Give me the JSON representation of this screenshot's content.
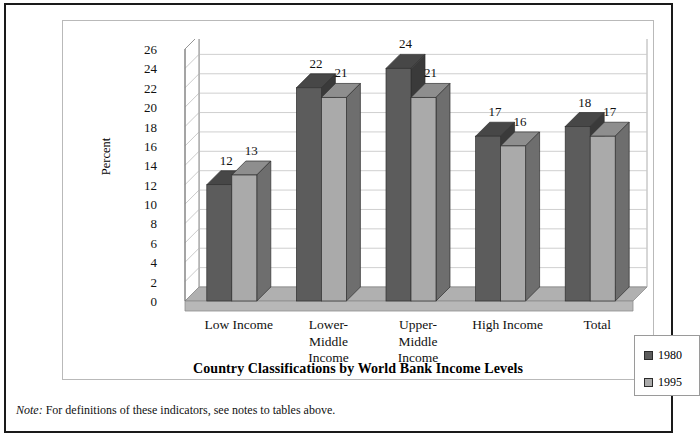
{
  "chart_data": {
    "type": "bar",
    "title": "Country Classifications by World Bank Income Levels",
    "xlabel": "",
    "ylabel": "Percent",
    "ylim": [
      0,
      26
    ],
    "ytick_step": 2,
    "yticks": [
      26,
      24,
      22,
      20,
      18,
      16,
      14,
      12,
      10,
      8,
      6,
      4,
      2,
      0
    ],
    "grid": true,
    "legend_position": "right-outside",
    "categories": [
      "Low Income",
      "Lower-\nMiddle\nIncome",
      "Upper-\nMiddle\nIncome",
      "High Income",
      "Total"
    ],
    "category_lines": [
      [
        "Low Income"
      ],
      [
        "Lower-",
        "Middle",
        "Income"
      ],
      [
        "Upper-",
        "Middle",
        "Income"
      ],
      [
        "High Income"
      ],
      [
        "Total"
      ]
    ],
    "series": [
      {
        "name": "1980",
        "color": "#5c5c5c",
        "values": [
          12,
          22,
          24,
          17,
          18
        ]
      },
      {
        "name": "1995",
        "color": "#aaaaaa",
        "values": [
          13,
          21,
          21,
          16,
          17
        ]
      }
    ]
  },
  "legend": {
    "items": [
      {
        "label": "1980",
        "color": "#5c5c5c"
      },
      {
        "label": "1995",
        "color": "#aaaaaa"
      }
    ]
  },
  "footnote": {
    "lead": "Note:",
    "text": "For definitions of these indicators, see notes to tables above."
  },
  "colors": {
    "series_1980_front": "#5c5c5c",
    "series_1980_side": "#3a3a3a",
    "series_1980_top": "#474747",
    "series_1995_front": "#aaaaaa",
    "series_1995_side": "#6e6e6e",
    "series_1995_top": "#8e8e8e",
    "floor": "#b0b0b0",
    "wall": "#ffffff",
    "gridline": "#c9c9c9",
    "frame_border": "#b9b9b9",
    "outer_border": "#1a1a1a"
  }
}
